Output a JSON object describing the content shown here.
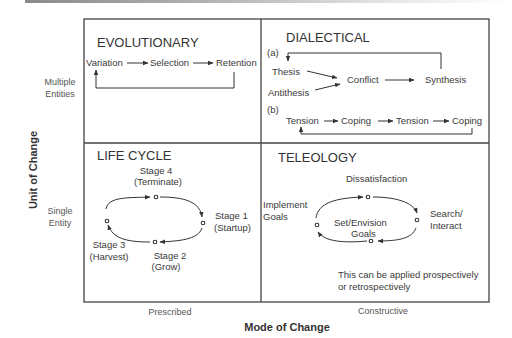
{
  "diagram": {
    "x_axis": {
      "title": "Mode of Change",
      "ticks": [
        "Prescribed",
        "Constructive"
      ]
    },
    "y_axis": {
      "title": "Unit of Change",
      "ticks": [
        {
          "line1": "Multiple",
          "line2": "Entities"
        },
        {
          "line1": "Single",
          "line2": "Entity"
        }
      ]
    },
    "quadrants": {
      "evolutionary": {
        "title": "EVOLUTIONARY",
        "nodes": [
          "Variation",
          "Selection",
          "Retention"
        ]
      },
      "dialectical": {
        "title": "DIALECTICAL",
        "part_a_label": "(a)",
        "part_a_nodes": [
          "Thesis",
          "Antithesis",
          "Conflict",
          "Synthesis"
        ],
        "part_b_label": "(b)",
        "part_b_nodes": [
          "Tension",
          "Coping",
          "Tension",
          "Coping"
        ]
      },
      "life_cycle": {
        "title": "LIFE CYCLE",
        "stages": [
          {
            "name": "Stage 1",
            "desc": "(Startup)"
          },
          {
            "name": "Stage 2",
            "desc": "(Grow)"
          },
          {
            "name": "Stage 3",
            "desc": "(Harvest)"
          },
          {
            "name": "Stage 4",
            "desc": "(Terminate)"
          }
        ]
      },
      "teleology": {
        "title": "TELEOLOGY",
        "top": "Dissatisfaction",
        "right_line1": "Search/",
        "right_line2": "Interact",
        "center_line1": "Set/Envision",
        "center_line2": "Goals",
        "left_line1": "Implement",
        "left_line2": "Goals",
        "note_line1": "This can be applied prospectively",
        "note_line2": "or retrospectively"
      }
    },
    "colors": {
      "frame": "#444444",
      "text": "#333333"
    }
  }
}
